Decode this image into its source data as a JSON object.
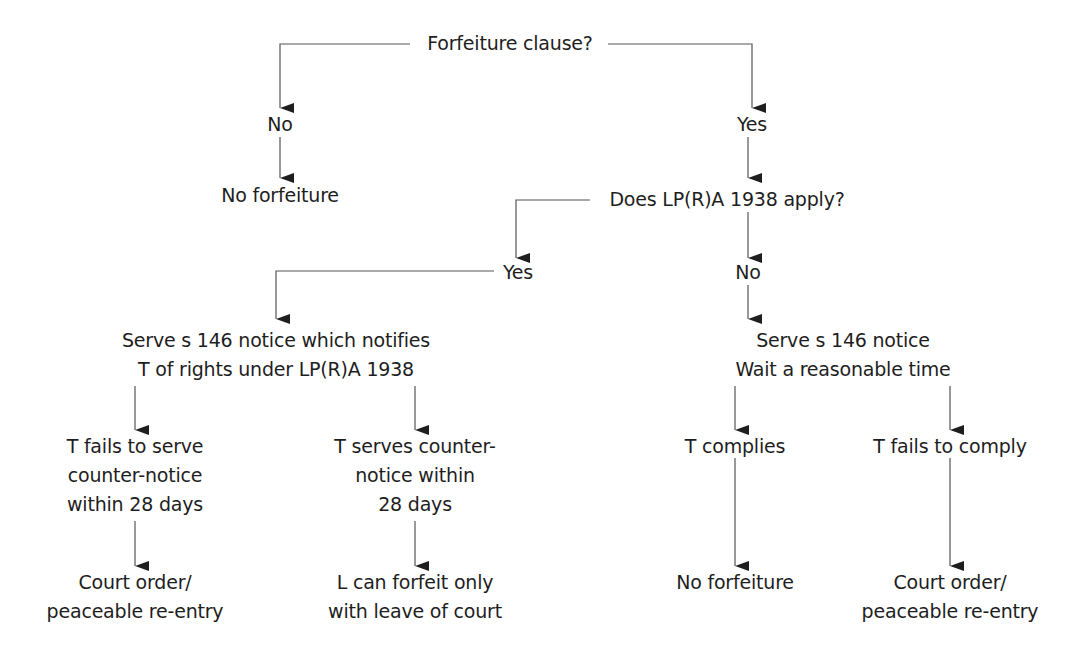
{
  "diagram": {
    "type": "flowchart",
    "colors": {
      "text": "#1e1e1e",
      "lines": "#555555",
      "background": "#ffffff"
    },
    "nodes": {
      "root": {
        "lines": [
          "Forfeiture clause?"
        ]
      },
      "no_top": {
        "lines": [
          "No"
        ]
      },
      "yes_top": {
        "lines": [
          "Yes"
        ]
      },
      "no_forfeiture_top": {
        "lines": [
          "No forfeiture"
        ]
      },
      "lpra_question": {
        "lines": [
          "Does LP(R)A 1938 apply?"
        ]
      },
      "lpra_yes": {
        "lines": [
          "Yes"
        ]
      },
      "lpra_no": {
        "lines": [
          "No"
        ]
      },
      "serve_notify": {
        "lines": [
          "Serve s 146 notice which notifies",
          "T of rights under LP(R)A 1938"
        ]
      },
      "serve_wait": {
        "lines": [
          "Serve s 146 notice",
          "Wait a reasonable time"
        ]
      },
      "t_fails_counter": {
        "lines": [
          "T fails to serve",
          "counter-notice",
          "within 28 days"
        ]
      },
      "t_serves_counter": {
        "lines": [
          "T serves counter-",
          "notice within",
          "28 days"
        ]
      },
      "t_complies": {
        "lines": [
          "T complies"
        ]
      },
      "t_fails_comply": {
        "lines": [
          "T fails to comply"
        ]
      },
      "court_order_left": {
        "lines": [
          "Court order/",
          "peaceable re-entry"
        ]
      },
      "leave_of_court": {
        "lines": [
          "L can forfeit only",
          "with leave of court"
        ]
      },
      "no_forfeiture_bottom": {
        "lines": [
          "No forfeiture"
        ]
      },
      "court_order_right": {
        "lines": [
          "Court order/",
          "peaceable re-entry"
        ]
      }
    },
    "edges": [
      [
        "root",
        "no_top"
      ],
      [
        "root",
        "yes_top"
      ],
      [
        "no_top",
        "no_forfeiture_top"
      ],
      [
        "yes_top",
        "lpra_question"
      ],
      [
        "lpra_question",
        "lpra_yes"
      ],
      [
        "lpra_question",
        "lpra_no"
      ],
      [
        "lpra_yes",
        "serve_notify"
      ],
      [
        "lpra_no",
        "serve_wait"
      ],
      [
        "serve_notify",
        "t_fails_counter"
      ],
      [
        "serve_notify",
        "t_serves_counter"
      ],
      [
        "serve_wait",
        "t_complies"
      ],
      [
        "serve_wait",
        "t_fails_comply"
      ],
      [
        "t_fails_counter",
        "court_order_left"
      ],
      [
        "t_serves_counter",
        "leave_of_court"
      ],
      [
        "t_complies",
        "no_forfeiture_bottom"
      ],
      [
        "t_fails_comply",
        "court_order_right"
      ]
    ]
  }
}
